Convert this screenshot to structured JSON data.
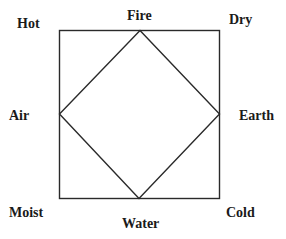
{
  "diagram": {
    "type": "square-of-opposition-elements",
    "corners": {
      "top_left": "Hot",
      "top_right": "Dry",
      "bottom_left": "Moist",
      "bottom_right": "Cold"
    },
    "vertices": {
      "top": "Fire",
      "right": "Earth",
      "bottom": "Water",
      "left": "Air"
    },
    "colors": {
      "line": "#2a2a2a",
      "text": "#1a1a1a",
      "background": "#ffffff"
    }
  }
}
